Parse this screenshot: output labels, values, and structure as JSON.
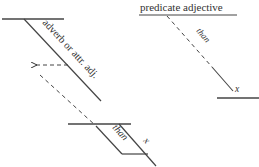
{
  "diagram": {
    "type": "sentence-diagram",
    "colors": {
      "line": "#333333",
      "background": "#ffffff"
    },
    "left_figure": {
      "modifier_label": "adverb or attr. adj.",
      "clause_connector_label": "than",
      "clause_subject_label": "x"
    },
    "right_figure": {
      "title_label": "predicate adjective",
      "connector_label": "than",
      "object_label": "x"
    }
  }
}
